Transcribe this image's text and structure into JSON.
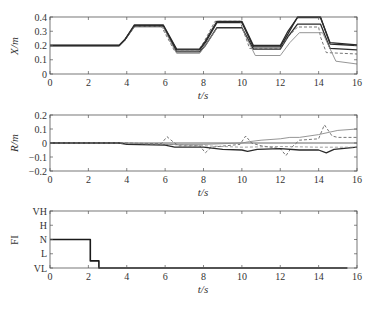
{
  "chart_data": [
    {
      "type": "line",
      "panel": "top",
      "ylabel": "X/m",
      "xlabel": "t/s",
      "xlim": [
        0,
        16
      ],
      "ylim": [
        0,
        0.4
      ],
      "xticks": [
        "0",
        "2",
        "4",
        "6",
        "8",
        "10",
        "12",
        "14",
        "16"
      ],
      "yticks": [
        "0",
        "0.1",
        "0.2",
        "0.3",
        "0.4"
      ],
      "series": [
        {
          "name": "line-1 (dark thick)",
          "style": "solid-dark",
          "x": [
            0,
            3.6,
            3.9,
            4.4,
            5.9,
            6.6,
            7.8,
            8.1,
            8.7,
            10.0,
            10.6,
            12.0,
            12.4,
            12.9,
            14.1,
            14.6,
            16
          ],
          "y": [
            0.2,
            0.2,
            0.24,
            0.34,
            0.34,
            0.17,
            0.17,
            0.22,
            0.36,
            0.36,
            0.19,
            0.19,
            0.28,
            0.4,
            0.4,
            0.21,
            0.2
          ]
        },
        {
          "name": "line-2 (dark)",
          "style": "solid-dark",
          "x": [
            0,
            3.6,
            3.9,
            4.4,
            5.9,
            6.6,
            7.8,
            8.1,
            8.7,
            10.0,
            10.6,
            12.0,
            12.4,
            12.9,
            14.1,
            14.6,
            16
          ],
          "y": [
            0.2,
            0.2,
            0.24,
            0.335,
            0.335,
            0.155,
            0.155,
            0.2,
            0.325,
            0.325,
            0.175,
            0.175,
            0.26,
            0.35,
            0.35,
            0.18,
            0.17
          ]
        },
        {
          "name": "line-3 (dashed)",
          "style": "dashed",
          "x": [
            0,
            3.6,
            3.9,
            4.4,
            5.8,
            6.5,
            7.7,
            8.0,
            8.6,
            9.9,
            10.4,
            12.0,
            12.4,
            12.9,
            14.0,
            14.1,
            14.4,
            16
          ],
          "y": [
            0.2,
            0.2,
            0.24,
            0.335,
            0.335,
            0.16,
            0.16,
            0.22,
            0.37,
            0.37,
            0.18,
            0.18,
            0.26,
            0.33,
            0.33,
            0.26,
            0.15,
            0.14
          ]
        },
        {
          "name": "line-4 (light gray)",
          "style": "solid-light",
          "x": [
            0,
            3.6,
            3.9,
            4.4,
            5.9,
            6.6,
            7.8,
            8.1,
            8.7,
            10.0,
            10.7,
            12.0,
            12.5,
            13.0,
            14.2,
            14.9,
            16
          ],
          "y": [
            0.2,
            0.2,
            0.24,
            0.33,
            0.33,
            0.145,
            0.145,
            0.2,
            0.32,
            0.32,
            0.13,
            0.13,
            0.22,
            0.29,
            0.29,
            0.09,
            0.07
          ]
        },
        {
          "name": "line-5 (dark upper)",
          "style": "solid-dark",
          "x": [
            0,
            3.6,
            3.9,
            4.4,
            5.9,
            6.6,
            7.8,
            8.1,
            8.7,
            10.0,
            10.6,
            12.0,
            12.4,
            12.9,
            14.1,
            14.6,
            16
          ],
          "y": [
            0.2,
            0.2,
            0.24,
            0.345,
            0.345,
            0.175,
            0.175,
            0.23,
            0.37,
            0.37,
            0.2,
            0.2,
            0.3,
            0.395,
            0.395,
            0.22,
            0.205
          ]
        }
      ]
    },
    {
      "type": "line",
      "panel": "middle",
      "ylabel": "R/m",
      "xlabel": "t/s",
      "xlim": [
        0,
        16
      ],
      "ylim": [
        -0.2,
        0.2
      ],
      "xticks": [
        "0",
        "2",
        "4",
        "6",
        "8",
        "10",
        "12",
        "14",
        "16"
      ],
      "yticks": [
        "-0.2",
        "-0.1",
        "0",
        "0.1",
        "0.2"
      ],
      "series": [
        {
          "name": "zero-reference (gray thick)",
          "style": "solid-gray",
          "x": [
            0,
            16
          ],
          "y": [
            0,
            0
          ]
        },
        {
          "name": "light gray rising",
          "style": "solid-light",
          "x": [
            0,
            3.6,
            6,
            8,
            10,
            10.4,
            11,
            12,
            12.5,
            13,
            14,
            15,
            16
          ],
          "y": [
            0,
            0,
            -0.01,
            -0.01,
            0.0,
            0.01,
            0.02,
            0.03,
            0.04,
            0.04,
            0.06,
            0.09,
            0.1
          ]
        },
        {
          "name": "dashed oscillating",
          "style": "dashed",
          "x": [
            0,
            3.6,
            5.8,
            6.1,
            6.4,
            6.7,
            7.8,
            8.1,
            8.4,
            9.9,
            10.2,
            10.5,
            11,
            12,
            12.3,
            12.6,
            13,
            14,
            14.3,
            14.7,
            15,
            16
          ],
          "y": [
            0,
            0,
            -0.005,
            0.045,
            0.01,
            -0.02,
            -0.02,
            -0.07,
            -0.03,
            -0.01,
            0.05,
            0.0,
            -0.02,
            -0.04,
            -0.09,
            -0.03,
            0.02,
            0.03,
            0.13,
            0.05,
            0.04,
            0.04
          ]
        },
        {
          "name": "dark lower",
          "style": "solid-dark",
          "x": [
            0,
            3.6,
            4,
            6,
            6.5,
            7,
            8,
            9,
            10,
            10.3,
            10.8,
            12,
            13,
            14,
            14.4,
            14.8,
            16
          ],
          "y": [
            0,
            0,
            -0.01,
            -0.015,
            -0.03,
            -0.03,
            -0.03,
            -0.045,
            -0.05,
            -0.06,
            -0.045,
            -0.04,
            -0.05,
            -0.05,
            -0.07,
            -0.045,
            -0.03
          ]
        },
        {
          "name": "dashed lower",
          "style": "dashed-light",
          "x": [
            0,
            3.6,
            6,
            8,
            10,
            12,
            14,
            16
          ],
          "y": [
            0,
            0,
            -0.01,
            -0.02,
            -0.03,
            -0.025,
            -0.03,
            -0.03
          ]
        }
      ]
    },
    {
      "type": "line",
      "panel": "bottom",
      "ylabel": "FI",
      "xlabel": "t/s",
      "xlim": [
        0,
        16
      ],
      "yticks": [
        "VL",
        "L",
        "N",
        "H",
        "VH"
      ],
      "xticks": [
        "0",
        "2",
        "4",
        "6",
        "8",
        "10",
        "12",
        "14",
        "16"
      ],
      "series": [
        {
          "name": "FI step",
          "style": "solid-dark-thick",
          "x": [
            0,
            2.1,
            2.1,
            2.55,
            2.55,
            15.5
          ],
          "y_level": [
            "N",
            "N",
            "VL+0.5",
            "VL+0.5",
            "VL",
            "VL"
          ],
          "y": [
            2,
            2,
            0.5,
            0.5,
            0,
            0
          ]
        }
      ]
    }
  ],
  "labels": {
    "top_ylabel": "X/m",
    "mid_ylabel": "R/m",
    "bot_ylabel": "FI",
    "xlabel": "t/s"
  }
}
